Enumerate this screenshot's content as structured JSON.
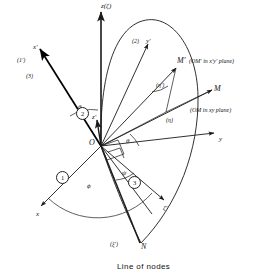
{
  "figure": {
    "caption": "Line of nodes",
    "line_color": "#1a1a1a",
    "heavy_color": "#000000",
    "ink": "#161616"
  },
  "axes": [
    {
      "id": "z",
      "label": "z(ζ)",
      "x": 101,
      "y": 3,
      "size": "sm"
    },
    {
      "id": "x",
      "label": "x",
      "x": 36,
      "y": 211,
      "size": "sm"
    },
    {
      "id": "y",
      "label": "y",
      "x": 219,
      "y": 136,
      "size": "sm"
    },
    {
      "id": "xprime",
      "label": "x′",
      "x": 33,
      "y": 44,
      "size": "sm"
    },
    {
      "id": "yprime",
      "label": "y′",
      "x": 146,
      "y": 38,
      "size": "sm"
    },
    {
      "id": "zprime",
      "label": "z′",
      "x": 92,
      "y": 114,
      "size": "sm"
    },
    {
      "id": "zeta",
      "label": "ζ′",
      "x": 163,
      "y": 205,
      "size": "sm"
    }
  ],
  "points": [
    {
      "id": "origin",
      "label": "O",
      "x": 101,
      "y": 146,
      "size": "md"
    },
    {
      "id": "m",
      "label": "M",
      "x": 214,
      "y": 85,
      "size": "md"
    },
    {
      "id": "mprime",
      "label": "M′",
      "x": 177,
      "y": 62,
      "size": "md"
    },
    {
      "id": "node",
      "label": "N",
      "x": 141,
      "y": 246,
      "size": "md"
    }
  ],
  "angles": [
    {
      "id": "phi",
      "label": "ϕ",
      "x": 87,
      "y": 183,
      "size": "sm"
    },
    {
      "id": "theta-left",
      "label": "θ",
      "x": 78,
      "y": 108,
      "size": "sm"
    },
    {
      "id": "theta-right",
      "label": "θ",
      "x": 124,
      "y": 140,
      "size": "sm"
    },
    {
      "id": "psi",
      "label": "ψ",
      "x": 122,
      "y": 173,
      "size": "sm"
    }
  ],
  "markers": [
    {
      "id": "rot-1",
      "label": "1",
      "x": 61,
      "y": 176
    },
    {
      "id": "rot-2",
      "label": "2",
      "x": 81,
      "y": 112
    },
    {
      "id": "rot-3",
      "label": "3",
      "x": 133,
      "y": 181
    }
  ],
  "bracket_labels": [
    {
      "id": "one-prime",
      "label": "(1′)",
      "x": 17,
      "y": 57,
      "size": "tiny"
    },
    {
      "id": "three",
      "label": "(3)",
      "x": 26,
      "y": 73,
      "size": "tiny"
    },
    {
      "id": "two",
      "label": "(2)",
      "x": 132,
      "y": 38,
      "size": "tiny"
    },
    {
      "id": "eta-prime",
      "label": "(η′)",
      "x": 158,
      "y": 82,
      "size": "tiny"
    },
    {
      "id": "eta",
      "label": "(η)",
      "x": 166,
      "y": 117,
      "size": "tiny"
    },
    {
      "id": "xi-prime",
      "label": "(ξ′)",
      "x": 113,
      "y": 243,
      "size": "tiny"
    }
  ],
  "annotations": [
    {
      "id": "m-prime-note",
      "label": "(OM′ in x′y′ plane)",
      "x": 189,
      "y": 62,
      "size": "tiny"
    },
    {
      "id": "m-note",
      "label": "(OM in xy plane)",
      "x": 190,
      "y": 110,
      "size": "tiny"
    }
  ],
  "caption_pos": {
    "x": 117,
    "y": 262
  }
}
